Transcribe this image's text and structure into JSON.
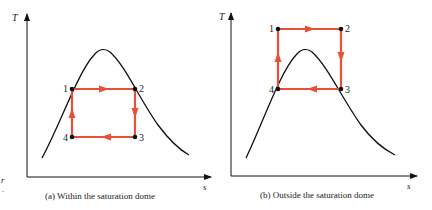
{
  "colors": {
    "cycle": "#e8503a",
    "dome": "#111111",
    "axis": "#111111",
    "point": "#111111"
  },
  "margin_text": {
    "line1": "r",
    "line2": "."
  },
  "panels": [
    {
      "id": "a",
      "y_axis_label": "T",
      "x_axis_label": "s",
      "caption_prefix": "(a)",
      "caption": "Within the saturation dome",
      "points": [
        {
          "label": "1",
          "x": 72,
          "y": 89
        },
        {
          "label": "2",
          "x": 135,
          "y": 89
        },
        {
          "label": "3",
          "x": 135,
          "y": 137
        },
        {
          "label": "4",
          "x": 72,
          "y": 137
        }
      ]
    },
    {
      "id": "b",
      "y_axis_label": "T",
      "x_axis_label": "s",
      "caption_prefix": "(b)",
      "caption": "Outside the saturation dome",
      "points": [
        {
          "label": "1",
          "x": 278,
          "y": 29
        },
        {
          "label": "2",
          "x": 341,
          "y": 29
        },
        {
          "label": "3",
          "x": 341,
          "y": 89
        },
        {
          "label": "4",
          "x": 278,
          "y": 89
        }
      ]
    }
  ]
}
